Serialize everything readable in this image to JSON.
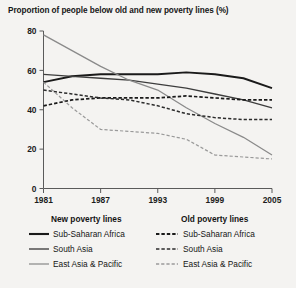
{
  "chart_data": {
    "type": "line",
    "title": "Proportion of people below old and new poverty lines (%)",
    "xlabel": "",
    "ylabel": "",
    "xlim": [
      1981,
      2005
    ],
    "ylim": [
      0,
      80
    ],
    "yticks": [
      "0",
      "20",
      "40",
      "60",
      "80"
    ],
    "ytick_values": [
      0,
      20,
      40,
      60,
      80
    ],
    "xticks": [
      "1981",
      "1987",
      "1993",
      "1999",
      "2005"
    ],
    "xtick_values": [
      1981,
      1987,
      1993,
      1999,
      2005
    ],
    "grid": false,
    "legend_position": "below",
    "x": [
      1981,
      1984,
      1987,
      1990,
      1993,
      1996,
      1999,
      2002,
      2005
    ],
    "series": [
      {
        "name": "Sub-Saharan Africa",
        "group": "New poverty lines",
        "style": "solid",
        "color": "#1a1a1a",
        "width": 1.9,
        "values": [
          54,
          57,
          58,
          58,
          58,
          59,
          58,
          56,
          51
        ]
      },
      {
        "name": "South Asia",
        "group": "New poverty lines",
        "style": "solid",
        "color": "#3d3d3d",
        "width": 1.3,
        "values": [
          58,
          57,
          56,
          55,
          53,
          51,
          48,
          45,
          41
        ]
      },
      {
        "name": "East Asia & Pacific",
        "group": "New poverty lines",
        "style": "solid",
        "color": "#8a8a8a",
        "width": 1.3,
        "values": [
          78,
          70,
          62,
          55,
          50,
          41,
          33,
          26,
          17
        ]
      },
      {
        "name": "Sub-Saharan Africa",
        "group": "Old poverty lines",
        "style": "dashed",
        "color": "#1a1a1a",
        "width": 1.7,
        "values": [
          42,
          45,
          46,
          46,
          46,
          47,
          46,
          45,
          45
        ]
      },
      {
        "name": "South Asia",
        "group": "Old poverty lines",
        "style": "dashed",
        "color": "#2b2b2b",
        "width": 1.5,
        "values": [
          50,
          48,
          46,
          45,
          42,
          38,
          36,
          35,
          35
        ]
      },
      {
        "name": "East Asia & Pacific",
        "group": "Old poverty lines",
        "style": "dashed",
        "color": "#9a9a9a",
        "width": 1.2,
        "values": [
          54,
          41,
          30,
          29,
          28,
          25,
          17,
          16,
          15
        ]
      }
    ]
  },
  "legend": {
    "columns": [
      {
        "header": "New poverty lines",
        "items": [
          {
            "label": "Sub-Saharan Africa"
          },
          {
            "label": "South Asia"
          },
          {
            "label": "East Asia & Pacific"
          }
        ]
      },
      {
        "header": "Old poverty lines",
        "items": [
          {
            "label": "Sub-Saharan Africa"
          },
          {
            "label": "South Asia"
          },
          {
            "label": "East Asia & Pacific"
          }
        ]
      }
    ]
  }
}
